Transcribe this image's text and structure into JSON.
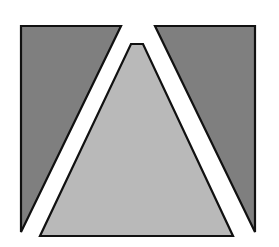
{
  "figure": {
    "colors": {
      "background": "#ffffff",
      "dark_fill": "#7f7f7f",
      "light_fill": "#b9b9b9",
      "stroke": "#111111"
    },
    "shapes": {
      "left_dark": {
        "points": "21,26 121,26 21,232"
      },
      "right_dark": {
        "points": "155,26 255,26 255,232"
      },
      "center_light": {
        "points": "131,44 143,44 233,236 40,236"
      }
    }
  }
}
